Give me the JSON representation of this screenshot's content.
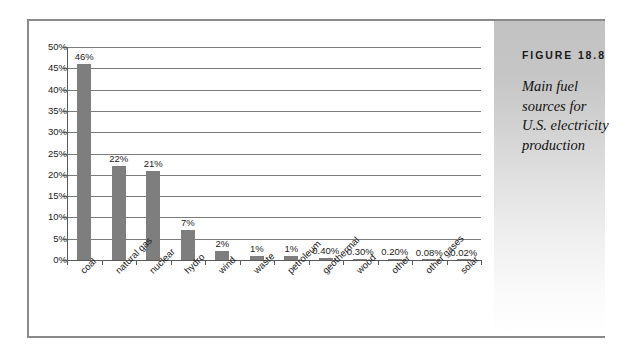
{
  "figure": {
    "number_label": "FIGURE 18.8",
    "caption": "Main fuel sources for U.S. electricity production"
  },
  "colors": {
    "bar": "#7e7e7e",
    "gridline": "#7d7d7d",
    "axis": "#5a5a5a",
    "frame": "#8a8a8a",
    "panel_top": "#c2c2c2",
    "panel_bottom": "#ffffff",
    "text": "#1c1c1c"
  },
  "chart_data": {
    "type": "bar",
    "title": "",
    "subtitle": "",
    "xlabel": "",
    "ylabel": "",
    "grid": true,
    "legend": false,
    "ylim": [
      0,
      50
    ],
    "ytick_step": 5,
    "ytick_labels": [
      "0%",
      "5%",
      "10%",
      "15%",
      "20%",
      "25%",
      "30%",
      "35%",
      "40%",
      "45%",
      "50%"
    ],
    "ytick_values": [
      0,
      5,
      10,
      15,
      20,
      25,
      30,
      35,
      40,
      45,
      50
    ],
    "categories": [
      "coal",
      "natural gas",
      "nuclear",
      "hydro",
      "wind",
      "waste",
      "petroleum",
      "geothermal",
      "wood",
      "other",
      "other gases",
      "solar"
    ],
    "values": [
      46,
      22,
      21,
      7,
      2,
      1,
      1,
      0.4,
      0.3,
      0.2,
      0.08,
      0.02
    ],
    "data_labels": [
      "46%",
      "22%",
      "21%",
      "7%",
      "2%",
      "1%",
      "1%",
      "0.40%",
      "0.30%",
      "0.20%",
      "0.08%",
      "0.02%"
    ]
  }
}
